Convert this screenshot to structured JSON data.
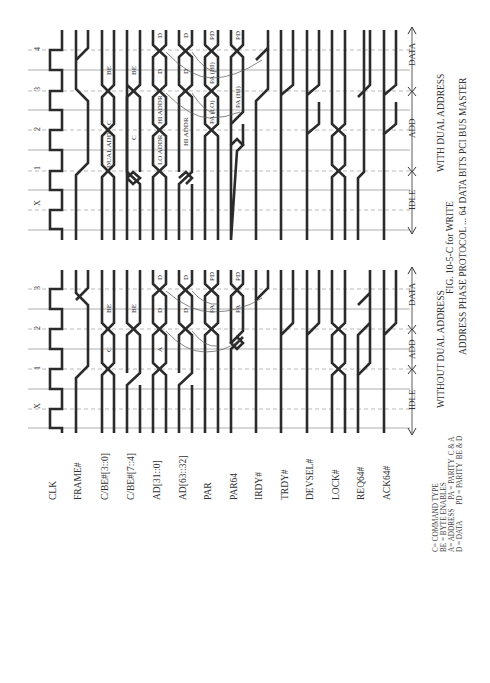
{
  "figure": {
    "title": "FIG. 10-5-C for WRITE",
    "subtitle": "ADDRESS PHASE PROTOCOL ... 64 DATA BITS PCI BUS MASTER"
  },
  "signals": [
    "CLK",
    "FRAME#",
    "C/BE#[3::0]",
    "C/BE#[7::4]",
    "AD[31::0]",
    "AD[63::32]",
    "PAR",
    "PAR64",
    "IRDY#",
    "TRDY#",
    "DEVSEL#",
    "LOCK#",
    "REQ64#",
    "ACK64#"
  ],
  "panels": {
    "without_dual": {
      "caption": "WITHOUT DUAL ADDRESS",
      "clock_labels": [
        "X",
        "1",
        "2",
        "3"
      ],
      "phases": {
        "idle": "IDLE",
        "add": "ADD",
        "data": "DATA"
      },
      "bus_labels": {
        "cbe30": [
          "C",
          "BE"
        ],
        "cbe74": [
          "BE"
        ],
        "ad31": [
          "A",
          "D",
          "D"
        ],
        "ad63": [
          "D",
          "D"
        ],
        "par": [
          "PA",
          "PD"
        ],
        "par64": [
          "PA",
          "PD"
        ]
      }
    },
    "with_dual": {
      "caption": "WITH DUAL ADDRESS",
      "clock_labels": [
        "X",
        "1",
        "2",
        "3",
        "4"
      ],
      "phases": {
        "idle": "IDLE",
        "add": "ADD",
        "data": "DATA"
      },
      "bus_labels": {
        "cbe30": [
          "DUAL ADD",
          "C",
          "BE"
        ],
        "cbe74": [
          "C",
          "BE"
        ],
        "ad31": [
          "LO ADDR",
          "HI ADDR",
          "D",
          "D"
        ],
        "ad63": [
          "HI ADDR",
          "D",
          "D"
        ],
        "par": [
          "PA (LO)",
          "PA (HI)",
          "PD"
        ],
        "par64": [
          "PA (HI)",
          "PD"
        ]
      }
    }
  },
  "legend": [
    "C= COMMAND TYPE",
    "BE = BYTE ENABLES",
    "A= ADDRESS     PA = PARITY  C & A",
    "D = DATA         PD = PARITY  BE & D"
  ]
}
